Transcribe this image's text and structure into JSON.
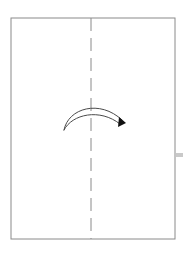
{
  "figure": {
    "kind": "origami-fold-diagram",
    "background_color": "#ffffff",
    "width": 183,
    "height": 254,
    "title": "",
    "caption": ""
  },
  "paper": {
    "name": "paper-sheet",
    "shape": "rectangle",
    "x": 11,
    "y": 18,
    "width": 164,
    "height": 221,
    "stroke_color": "#8a8a8a",
    "stroke_width": 1,
    "fill_color": "#ffffff"
  },
  "fold_line": {
    "name": "vertical-fold-crease",
    "style": "dashed",
    "orientation": "vertical",
    "x": 91,
    "y_start": 18,
    "y_end": 239,
    "dash_length": 13,
    "gap_length": 7,
    "stroke_color": "#8a8a8a",
    "stroke_width": 1,
    "label": "fold here"
  },
  "fold_arrow": {
    "name": "valley-fold-arrow",
    "direction": "right",
    "meaning": "fold left edge over to the right",
    "stroke_color": "#4a4a4a",
    "stroke_width": 1,
    "outer_arc": "M 64 130 C 68 108, 100 99, 122 120",
    "inner_arc": "M 64 130 C 72 114, 100 108, 120 124",
    "arrowhead": {
      "name": "arrowhead",
      "points": "119,117 126,123 118,127",
      "fill_color": "#111111"
    }
  },
  "edge_marker": {
    "name": "right-edge-tab-marker",
    "x": 176,
    "y": 153,
    "width": 7,
    "height": 4,
    "fill_color": "#c9c9c9",
    "label": ""
  }
}
